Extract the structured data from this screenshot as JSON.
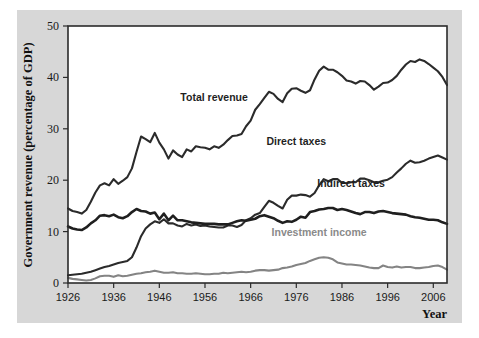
{
  "chart_data": {
    "type": "line",
    "title": "",
    "xlabel": "Year",
    "ylabel": "Government revenue (percentage of GDP)",
    "xlim": [
      1926,
      2009
    ],
    "ylim": [
      0,
      50
    ],
    "grid": false,
    "legend_position": "inline-annotations",
    "xticks": [
      1926,
      1936,
      1946,
      1956,
      1966,
      1976,
      1986,
      1996,
      2006
    ],
    "yticks": [
      0,
      10,
      20,
      30,
      40,
      50
    ],
    "x": [
      1926,
      1927,
      1928,
      1929,
      1930,
      1931,
      1932,
      1933,
      1934,
      1935,
      1936,
      1937,
      1938,
      1939,
      1940,
      1941,
      1942,
      1943,
      1944,
      1945,
      1946,
      1947,
      1948,
      1949,
      1950,
      1951,
      1952,
      1953,
      1954,
      1955,
      1956,
      1957,
      1958,
      1959,
      1960,
      1961,
      1962,
      1963,
      1964,
      1965,
      1966,
      1967,
      1968,
      1969,
      1970,
      1971,
      1972,
      1973,
      1974,
      1975,
      1976,
      1977,
      1978,
      1979,
      1980,
      1981,
      1982,
      1983,
      1984,
      1985,
      1986,
      1987,
      1988,
      1989,
      1990,
      1991,
      1992,
      1993,
      1994,
      1995,
      1996,
      1997,
      1998,
      1999,
      2000,
      2001,
      2002,
      2003,
      2004,
      2005,
      2006,
      2007,
      2008,
      2009
    ],
    "series": [
      {
        "name": "Total revenue",
        "color": "#2b2b2b",
        "width": 2.1,
        "label_x": 1958,
        "label_y": 35.5,
        "values": [
          14.5,
          14.0,
          13.8,
          13.5,
          14.2,
          15.8,
          17.6,
          19.0,
          19.4,
          19.0,
          20.2,
          19.3,
          19.9,
          20.6,
          22.3,
          25.5,
          28.5,
          28.0,
          27.4,
          29.2,
          27.3,
          26.0,
          24.2,
          25.8,
          25.0,
          24.5,
          26.0,
          25.6,
          26.6,
          26.4,
          26.3,
          26.0,
          26.6,
          26.3,
          26.9,
          27.8,
          28.6,
          28.7,
          29.0,
          30.5,
          31.6,
          33.7,
          34.8,
          36.0,
          37.2,
          36.8,
          35.8,
          35.2,
          36.9,
          37.8,
          37.9,
          37.4,
          37.0,
          37.5,
          39.6,
          41.3,
          42.1,
          41.5,
          41.5,
          41.0,
          40.3,
          39.4,
          39.2,
          38.8,
          39.3,
          39.2,
          38.5,
          37.6,
          38.2,
          38.9,
          39.0,
          39.5,
          40.3,
          41.5,
          42.5,
          43.2,
          43.0,
          43.5,
          43.2,
          42.6,
          41.9,
          41.2,
          40.1,
          38.5
        ]
      },
      {
        "name": "Direct taxes",
        "color": "#2b2b2b",
        "width": 2.1,
        "label_x": 1976,
        "label_y": 26.8,
        "values": [
          1.5,
          1.6,
          1.7,
          1.8,
          2.0,
          2.2,
          2.5,
          2.8,
          3.1,
          3.3,
          3.6,
          3.9,
          4.1,
          4.3,
          5.0,
          6.9,
          9.1,
          10.6,
          11.4,
          12.0,
          11.7,
          12.4,
          11.6,
          11.6,
          11.2,
          11.0,
          11.5,
          11.2,
          11.4,
          11.1,
          11.2,
          11.0,
          10.9,
          10.8,
          10.8,
          11.2,
          11.2,
          10.9,
          11.3,
          12.2,
          12.6,
          13.3,
          13.6,
          14.8,
          16.0,
          15.6,
          15.0,
          14.5,
          16.2,
          17.0,
          17.0,
          17.2,
          17.1,
          16.8,
          17.5,
          19.0,
          20.2,
          19.8,
          20.2,
          20.2,
          19.5,
          19.4,
          19.6,
          19.6,
          20.3,
          20.3,
          20.0,
          19.6,
          19.6,
          19.9,
          20.1,
          20.6,
          21.5,
          22.3,
          23.2,
          23.8,
          23.4,
          23.5,
          23.8,
          24.2,
          24.5,
          24.8,
          24.4,
          24.0
        ]
      },
      {
        "name": "Indirect taxes",
        "color": "#1f1f1f",
        "width": 2.6,
        "label_x": 1988,
        "label_y": 18.6,
        "values": [
          11.0,
          10.6,
          10.4,
          10.3,
          10.8,
          11.6,
          12.2,
          13.1,
          13.2,
          13.0,
          13.3,
          12.8,
          12.6,
          13.0,
          13.8,
          14.4,
          14.0,
          13.9,
          13.5,
          13.7,
          12.4,
          13.5,
          12.2,
          13.1,
          12.2,
          12.2,
          12.0,
          11.8,
          11.7,
          11.6,
          11.5,
          11.5,
          11.5,
          11.4,
          11.4,
          11.4,
          11.7,
          12.0,
          12.2,
          12.1,
          12.3,
          12.5,
          13.0,
          13.2,
          12.9,
          12.6,
          12.1,
          11.7,
          12.0,
          11.9,
          12.3,
          12.9,
          12.7,
          13.8,
          14.0,
          14.3,
          14.4,
          14.6,
          14.6,
          14.2,
          14.4,
          14.2,
          13.9,
          13.6,
          13.4,
          13.8,
          13.8,
          13.6,
          13.9,
          14.0,
          13.8,
          13.6,
          13.5,
          13.4,
          13.3,
          13.0,
          12.8,
          12.7,
          12.5,
          12.3,
          12.3,
          12.2,
          11.8,
          11.5
        ]
      },
      {
        "name": "Investment income",
        "color": "#848484",
        "width": 2.1,
        "label_x": 1981,
        "label_y": 9.2,
        "values": [
          1.0,
          0.8,
          0.7,
          0.6,
          0.5,
          0.6,
          0.9,
          1.3,
          1.4,
          1.4,
          1.2,
          1.5,
          1.3,
          1.4,
          1.6,
          1.8,
          1.9,
          2.1,
          2.2,
          2.4,
          2.2,
          2.0,
          2.0,
          2.1,
          1.9,
          1.9,
          1.8,
          1.8,
          1.9,
          1.8,
          1.7,
          1.7,
          1.8,
          1.8,
          2.0,
          1.9,
          2.0,
          2.1,
          2.2,
          2.1,
          2.2,
          2.4,
          2.5,
          2.5,
          2.4,
          2.5,
          2.6,
          2.9,
          3.0,
          3.2,
          3.5,
          3.7,
          3.9,
          4.3,
          4.6,
          4.9,
          5.0,
          4.9,
          4.6,
          4.0,
          3.8,
          3.6,
          3.6,
          3.5,
          3.4,
          3.2,
          3.0,
          2.9,
          2.9,
          3.4,
          3.1,
          3.0,
          3.2,
          3.0,
          3.1,
          3.1,
          2.9,
          2.9,
          3.0,
          3.1,
          3.3,
          3.4,
          3.1,
          2.6
        ]
      }
    ]
  },
  "axis": {
    "y_title": "Government revenue (percentage of GDP)",
    "x_title": "Year"
  },
  "labels": {
    "total_revenue": "Total revenue",
    "direct_taxes": "Direct taxes",
    "indirect_taxes": "Indirect taxes",
    "investment_income": "Investment income"
  },
  "yticks_text": [
    "0",
    "10",
    "20",
    "30",
    "40",
    "50"
  ],
  "xticks_text": [
    "1926",
    "1936",
    "1946",
    "1956",
    "1966",
    "1976",
    "1986",
    "1996",
    "2006"
  ],
  "colors": {
    "panel_background": "#d7d7d7",
    "plot_background": "#ffffff",
    "axis": "#2b2b2b",
    "dark_series": "#2b2b2b",
    "gray_series": "#848484"
  }
}
